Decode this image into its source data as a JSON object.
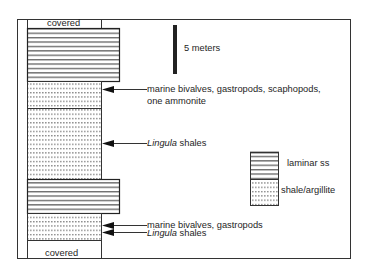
{
  "diagram": {
    "type": "stratigraphic-column",
    "scale_bar": {
      "label": "5 meters"
    },
    "column_units_top_to_bottom": [
      {
        "id": "covered_top",
        "lithology": "covered",
        "label": "covered"
      },
      {
        "id": "ss_upper",
        "lithology": "laminar ss"
      },
      {
        "id": "shale_1",
        "lithology": "shale/argillite"
      },
      {
        "id": "shale_2",
        "lithology": "shale/argillite"
      },
      {
        "id": "ss_lower",
        "lithology": "laminar ss"
      },
      {
        "id": "shale_3",
        "lithology": "shale/argillite"
      },
      {
        "id": "covered_bottom",
        "lithology": "covered",
        "label": "covered"
      }
    ],
    "annotations": [
      {
        "line1": "marine bivalves, gastropods, scaphopods,",
        "line2": "one ammonite"
      },
      {
        "italic": "Lingula",
        "rest": " shales"
      },
      {
        "text": "marine bivalves, gastropods"
      },
      {
        "italic": "Lingula",
        "rest": " shales"
      }
    ],
    "legend": [
      {
        "label": "laminar ss",
        "pattern": "horizontal-lines"
      },
      {
        "label": "shale/argillite",
        "pattern": "dots"
      }
    ]
  }
}
